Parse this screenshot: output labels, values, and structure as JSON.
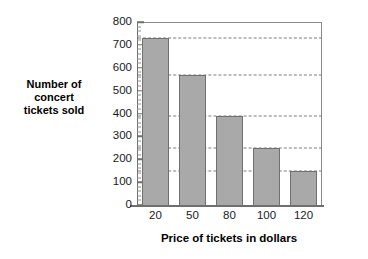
{
  "chart_data": {
    "type": "bar",
    "title": "",
    "xlabel": "Price of tickets in dollars",
    "ylabel": "Number of concert tickets sold",
    "ylabel_lines": [
      "Number of",
      "concert",
      "tickets sold"
    ],
    "categories": [
      "20",
      "50",
      "80",
      "100",
      "120"
    ],
    "values": [
      730,
      570,
      390,
      250,
      150
    ],
    "ylim": [
      0,
      800
    ],
    "ytick_labels": [
      "0",
      "100",
      "200",
      "300",
      "400",
      "500",
      "600",
      "700",
      "800"
    ],
    "ytick_values": [
      0,
      100,
      200,
      300,
      400,
      500,
      600,
      700,
      800
    ],
    "yminor_step": 20,
    "grid": "dashed horizontal gridlines drawn at each bar top extending to the right frame",
    "legend": "none",
    "bar_color": "#a9a9a9",
    "bar_edge_color": "#707070",
    "axis_color": "#6e6e6e",
    "grid_color": "#7d7d7d",
    "text_color": "#1a1a1a"
  }
}
